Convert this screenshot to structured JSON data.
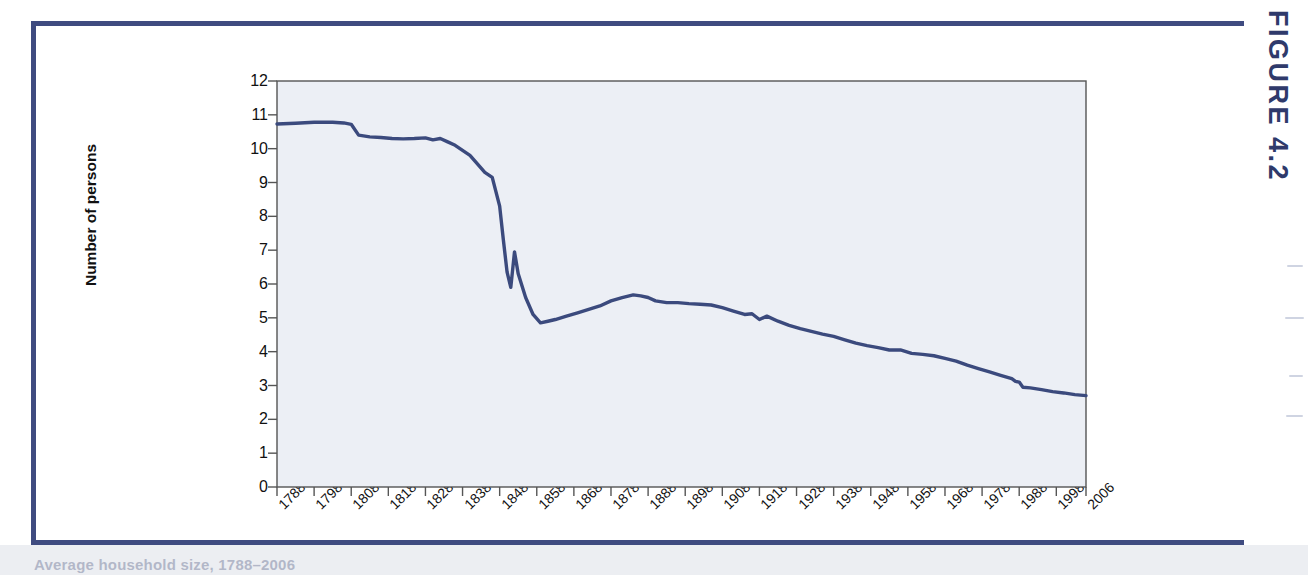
{
  "figure": {
    "label": "FIGURE 4.2",
    "caption": "Average household size, 1788–2006"
  },
  "colors": {
    "frame": "#3f4b80",
    "line": "#3b4a7d",
    "plot_background": "#eceff5",
    "axis": "#555555",
    "text": "#111111",
    "page_band": "#eceef2"
  },
  "chart_data": {
    "type": "line",
    "title": "",
    "xlabel": "",
    "ylabel": "Number of persons",
    "xlim": [
      1788,
      2006
    ],
    "ylim": [
      0,
      12
    ],
    "grid": false,
    "legend": "none",
    "ytick_labels": [
      "0",
      "1",
      "2",
      "3",
      "4",
      "5",
      "6",
      "7",
      "8",
      "9",
      "10",
      "11",
      "12"
    ],
    "ytick_values": [
      0,
      1,
      2,
      3,
      4,
      5,
      6,
      7,
      8,
      9,
      10,
      11,
      12
    ],
    "xtick_labels": [
      "1788",
      "1798",
      "1808",
      "1818",
      "1828",
      "1838",
      "1848",
      "1858",
      "1868",
      "1878",
      "1888",
      "1898",
      "1908",
      "1918",
      "1928",
      "1938",
      "1948",
      "1958",
      "1968",
      "1978",
      "1988",
      "1998",
      "2006"
    ],
    "xtick_values": [
      1788,
      1798,
      1808,
      1818,
      1828,
      1838,
      1848,
      1858,
      1868,
      1878,
      1888,
      1898,
      1908,
      1918,
      1928,
      1938,
      1948,
      1958,
      1968,
      1978,
      1988,
      1998,
      2006
    ],
    "series": [
      {
        "name": "Number of persons",
        "x": [
          1788,
          1793,
          1798,
          1803,
          1806,
          1808,
          1810,
          1813,
          1816,
          1819,
          1822,
          1825,
          1828,
          1830,
          1832,
          1834,
          1836,
          1838,
          1840,
          1842,
          1844,
          1846,
          1848,
          1849,
          1850,
          1851,
          1852,
          1853,
          1855,
          1857,
          1859,
          1861,
          1863,
          1866,
          1869,
          1872,
          1875,
          1878,
          1881,
          1884,
          1886,
          1888,
          1890,
          1893,
          1896,
          1899,
          1902,
          1905,
          1908,
          1911,
          1914,
          1916,
          1918,
          1920,
          1923,
          1926,
          1929,
          1932,
          1935,
          1938,
          1941,
          1944,
          1947,
          1950,
          1953,
          1956,
          1959,
          1962,
          1965,
          1968,
          1971,
          1974,
          1977,
          1980,
          1983,
          1986,
          1987,
          1988,
          1989,
          1991,
          1994,
          1997,
          2000,
          2003,
          2006
        ],
        "y": [
          10.73,
          10.75,
          10.78,
          10.78,
          10.76,
          10.72,
          10.4,
          10.35,
          10.33,
          10.3,
          10.29,
          10.3,
          10.32,
          10.26,
          10.3,
          10.2,
          10.1,
          9.95,
          9.8,
          9.55,
          9.3,
          9.15,
          8.3,
          7.3,
          6.35,
          5.9,
          6.95,
          6.3,
          5.6,
          5.1,
          4.85,
          4.9,
          4.95,
          5.05,
          5.15,
          5.25,
          5.35,
          5.5,
          5.6,
          5.68,
          5.65,
          5.6,
          5.5,
          5.45,
          5.45,
          5.42,
          5.4,
          5.38,
          5.3,
          5.2,
          5.1,
          5.12,
          4.95,
          5.05,
          4.9,
          4.78,
          4.68,
          4.6,
          4.52,
          4.45,
          4.35,
          4.25,
          4.18,
          4.12,
          4.05,
          4.05,
          3.95,
          3.92,
          3.88,
          3.8,
          3.72,
          3.6,
          3.5,
          3.4,
          3.3,
          3.2,
          3.12,
          3.1,
          2.95,
          2.93,
          2.88,
          2.82,
          2.78,
          2.73,
          2.7
        ]
      }
    ]
  }
}
